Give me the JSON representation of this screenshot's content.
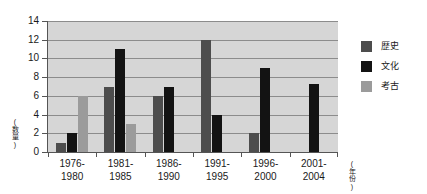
{
  "chart_data": {
    "type": "bar",
    "title": "",
    "xlabel": "(年份)",
    "ylabel": "(数量)",
    "ylim": [
      0,
      14
    ],
    "ystep": 2,
    "yticks": [
      "14",
      "12",
      "10",
      "8",
      "6",
      "4",
      "2",
      "0"
    ],
    "grid": true,
    "legend_position": "right",
    "categories": [
      "1976-\n1980",
      "1981-\n1985",
      "1986-\n1990",
      "1991-\n1995",
      "1996-\n2000",
      "2001-\n2004"
    ],
    "category_lines": [
      [
        "1976-",
        "1980"
      ],
      [
        "1981-",
        "1985"
      ],
      [
        "1986-",
        "1990"
      ],
      [
        "1991-",
        "1995"
      ],
      [
        "1996-",
        "2000"
      ],
      [
        "2001-",
        "2004"
      ]
    ],
    "series": [
      {
        "name": "歴史",
        "color": "#4d4d4d",
        "values": [
          1,
          7,
          6,
          12,
          2,
          0
        ]
      },
      {
        "name": "文化",
        "color": "#131313",
        "values": [
          2,
          11,
          7,
          4,
          9,
          7.3
        ]
      },
      {
        "name": "考古",
        "color": "#9b9b9b",
        "values": [
          6,
          3,
          0,
          0,
          0,
          0
        ]
      }
    ]
  },
  "legend": {
    "items": [
      {
        "label": "歴史",
        "color": "#4d4d4d"
      },
      {
        "label": "文化",
        "color": "#131313"
      },
      {
        "label": "考古",
        "color": "#9b9b9b"
      }
    ]
  },
  "axes": {
    "y_title_chars": [
      "(",
      "数",
      "量",
      ")"
    ],
    "x_title_chars": [
      "(",
      "年",
      "份",
      ")"
    ]
  }
}
